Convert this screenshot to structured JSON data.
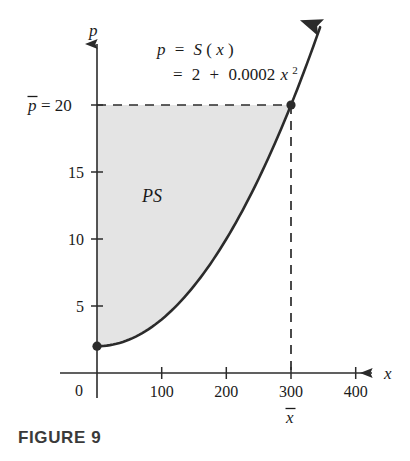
{
  "figure": {
    "caption": "FIGURE 9",
    "region_label": "PS"
  },
  "equation": {
    "line1_lhs": "p",
    "line1_eq": "=",
    "line1_rhs_fn": "S",
    "line1_rhs_open": "(",
    "line1_rhs_var": "x",
    "line1_rhs_close": ")",
    "line2_eq": "=",
    "line2_const": "2",
    "line2_plus": "+",
    "line2_coef": "0.0002",
    "line2_var": "x",
    "line2_exp": "2"
  },
  "axes": {
    "x_axis_name": "x",
    "y_axis_name": "p",
    "origin_label": "0",
    "x_ticks": [
      "100",
      "200",
      "300",
      "400"
    ],
    "x_tick_values": [
      100,
      200,
      300,
      400
    ],
    "y_ticks": [
      "5",
      "10",
      "15"
    ],
    "y_tick_values": [
      5,
      10,
      15
    ]
  },
  "annotations": {
    "p_bar_label": "p",
    "p_bar_equals": "= 20",
    "p_bar_value": 20,
    "x_bar_label": "x",
    "x_bar_value": 300
  },
  "chart_data": {
    "type": "line",
    "title": "FIGURE 9",
    "xlabel": "x",
    "ylabel": "p",
    "xlim": [
      0,
      430
    ],
    "ylim": [
      0,
      27
    ],
    "grid": false,
    "legend": null,
    "function": "p = S(x) = 2 + 0.0002x^2",
    "series": [
      {
        "name": "S(x) = 2 + 0.0002x^2",
        "x": [
          0,
          25,
          50,
          75,
          100,
          125,
          150,
          175,
          200,
          225,
          250,
          275,
          300,
          325
        ],
        "values": [
          2,
          2.125,
          2.5,
          3.125,
          4,
          5.125,
          6.5,
          8.125,
          10,
          12.125,
          14.5,
          17.125,
          20,
          23.125
        ]
      }
    ],
    "points": [
      {
        "x": 0,
        "y": 2,
        "label": ""
      },
      {
        "x": 300,
        "y": 20,
        "label": "equilibrium"
      }
    ],
    "shaded_region": {
      "name": "PS",
      "description": "Producer surplus: region between p-bar = 20 and the supply curve for x from 0 to 300",
      "x_range": [
        0,
        300
      ],
      "upper": 20,
      "lower_curve": "2 + 0.0002x^2",
      "color": "#e4e4e4"
    },
    "annotations": [
      {
        "text": "p = 20",
        "type": "horizontal-dashed",
        "y": 20
      },
      {
        "text": "x = 300",
        "type": "vertical-dashed",
        "x": 300
      }
    ],
    "colors": {
      "curve": "#2b2b2b",
      "axis": "#3a3a3a",
      "shade": "#e4e4e4",
      "dashed": "#2b2b2b"
    }
  }
}
